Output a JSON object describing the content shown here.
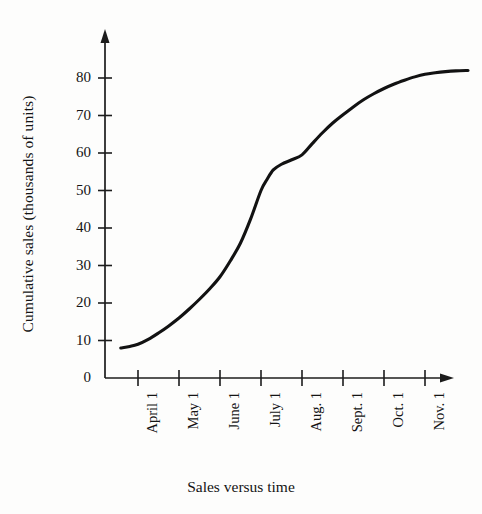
{
  "chart_data": {
    "type": "line",
    "title": "",
    "subtitle": "",
    "xlabel": "Sales versus time",
    "ylabel": "Cumulative sales (thousands of units)",
    "categories": [
      "April 1",
      "May 1",
      "June 1",
      "July 1",
      "Aug. 1",
      "Sept. 1",
      "Oct. 1",
      "Nov. 1"
    ],
    "series": [
      {
        "name": "Cumulative sales",
        "values": [
          9,
          16,
          27,
          50,
          59,
          70,
          77,
          81
        ]
      }
    ],
    "curve_points": [
      {
        "x": -0.42,
        "y": 8.0
      },
      {
        "x": -0.2,
        "y": 8.4
      },
      {
        "x": 0.0,
        "y": 9.0
      },
      {
        "x": 0.25,
        "y": 10.3
      },
      {
        "x": 0.5,
        "y": 12.0
      },
      {
        "x": 0.75,
        "y": 13.9
      },
      {
        "x": 1.0,
        "y": 16.0
      },
      {
        "x": 1.25,
        "y": 18.4
      },
      {
        "x": 1.5,
        "y": 21.0
      },
      {
        "x": 1.75,
        "y": 23.8
      },
      {
        "x": 2.0,
        "y": 27.0
      },
      {
        "x": 2.25,
        "y": 31.2
      },
      {
        "x": 2.5,
        "y": 36.0
      },
      {
        "x": 2.75,
        "y": 42.5
      },
      {
        "x": 3.0,
        "y": 50.0
      },
      {
        "x": 3.15,
        "y": 53.0
      },
      {
        "x": 3.3,
        "y": 55.5
      },
      {
        "x": 3.5,
        "y": 57.0
      },
      {
        "x": 3.75,
        "y": 58.2
      },
      {
        "x": 4.0,
        "y": 59.5
      },
      {
        "x": 4.25,
        "y": 62.5
      },
      {
        "x": 4.5,
        "y": 65.4
      },
      {
        "x": 4.75,
        "y": 68.0
      },
      {
        "x": 5.0,
        "y": 70.2
      },
      {
        "x": 5.25,
        "y": 72.3
      },
      {
        "x": 5.5,
        "y": 74.2
      },
      {
        "x": 5.75,
        "y": 75.8
      },
      {
        "x": 6.0,
        "y": 77.2
      },
      {
        "x": 6.25,
        "y": 78.4
      },
      {
        "x": 6.5,
        "y": 79.4
      },
      {
        "x": 6.75,
        "y": 80.3
      },
      {
        "x": 7.0,
        "y": 81.0
      },
      {
        "x": 7.25,
        "y": 81.4
      },
      {
        "x": 7.5,
        "y": 81.7
      },
      {
        "x": 7.75,
        "y": 81.9
      },
      {
        "x": 8.05,
        "y": 82.0
      }
    ],
    "yticks": [
      0,
      10,
      20,
      30,
      40,
      50,
      60,
      70,
      80
    ],
    "ytick_labels": [
      "0",
      "10",
      "20",
      "30",
      "40",
      "50",
      "60",
      "70",
      "80"
    ],
    "ylim": [
      0,
      88
    ],
    "xlim": [
      -0.85,
      8.4
    ],
    "grid": false,
    "legend": null,
    "line_color": "#121212",
    "axis_color": "#1c1c1c"
  }
}
